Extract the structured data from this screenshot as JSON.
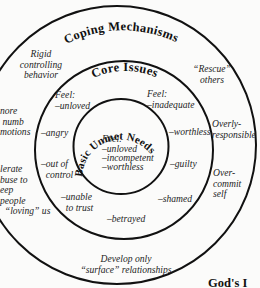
{
  "diagram": {
    "rings": {
      "outer": {
        "title": "Coping Mechanisms"
      },
      "middle": {
        "title": "Core Issues"
      },
      "inner": {
        "title": "Basic Unmet Needs"
      }
    },
    "inner": {
      "feel_label": "Feel:",
      "items": [
        "–unloved",
        "–incompetent",
        "–worthless"
      ]
    },
    "core_issues": {
      "feel_left": "Feel:\n–unloved",
      "feel_right": "Feel:\n–inadequate",
      "angry": "–angry",
      "worthless": "–worthless",
      "out_of_control": "–out of\n  control",
      "guilty": "–guilty",
      "unable_to_trust": "–unable\n  to trust",
      "shamed": "–shamed",
      "betrayed": "–betrayed"
    },
    "coping": {
      "rigid": "Rigid\ncontrolling\nbehavior",
      "rescue": "“Rescue”\nothers",
      "ignore": "nore\n numb\nmotions",
      "overly": "Overly-\nresponsible",
      "tolerate": "lerate\nbuse to\neep\npeople\n  “loving” us",
      "overcommit": "Over-\ncommit\nself",
      "surface": "Develop only\n“surface” relationships"
    },
    "footer_text": "God's I"
  }
}
